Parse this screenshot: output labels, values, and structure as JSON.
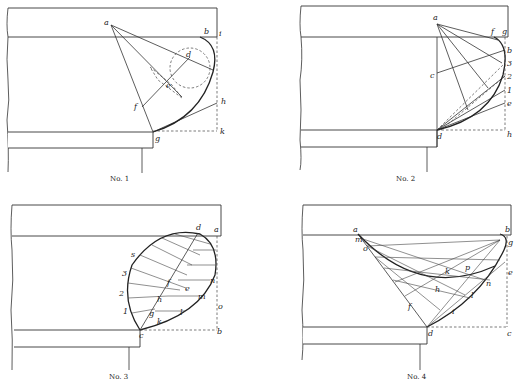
{
  "figures": [
    {
      "caption": "No. 1",
      "labels": {
        "a": "a",
        "b": "b",
        "i": "i",
        "d": "d",
        "e": "e",
        "f": "f",
        "h": "h",
        "g": "g",
        "k": "k",
        "c": "c"
      }
    },
    {
      "caption": "No. 2",
      "labels": {
        "a": "a",
        "f": "f",
        "g": "g",
        "b": "b",
        "n3": "3",
        "n2": "2",
        "n1": "1",
        "e": "e",
        "c": "c",
        "d": "d",
        "h": "h",
        "i": "i",
        "l2": "2",
        "l3": "3"
      }
    },
    {
      "caption": "No. 3",
      "labels": {
        "d": "d",
        "a": "a",
        "s": "s",
        "n3": "3",
        "n2": "2",
        "n1": "1",
        "n": "n",
        "f": "f",
        "e": "e",
        "m": "m",
        "h": "h",
        "o": "o",
        "g": "g",
        "l": "l",
        "k": "k",
        "c": "c",
        "b": "b"
      }
    },
    {
      "caption": "No. 4",
      "labels": {
        "a": "a",
        "b": "b",
        "m": "m",
        "o": "o",
        "g": "g",
        "p": "p",
        "k": "k",
        "e": "e",
        "n": "n",
        "h": "h",
        "l": "l",
        "f": "f",
        "i": "i",
        "d": "d",
        "c": "c"
      }
    }
  ]
}
